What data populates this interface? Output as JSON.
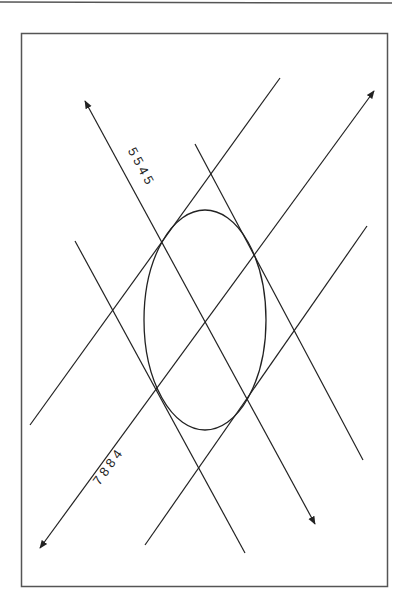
{
  "diagram": {
    "type": "ellipse-with-tangent-lines-and-axes",
    "colors": {
      "stroke": "#222222",
      "frame": "#555555",
      "background": "#ffffff"
    },
    "axis_labels": {
      "axis_a": "5 5 4 5",
      "axis_b": "7 8 8 4"
    }
  }
}
